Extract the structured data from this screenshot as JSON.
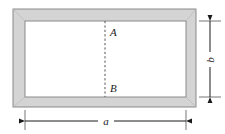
{
  "figure": {
    "type": "engineering-diagram",
    "background_color": "#ffffff",
    "frame": {
      "band_fill": "#d4d4d4",
      "outline_color": "#8a8a8a",
      "inner_fill": "#ffffff",
      "outer": {
        "x": 13,
        "y": 9,
        "width": 183,
        "height": 98
      },
      "inner": {
        "x": 25,
        "y": 21,
        "width": 161,
        "height": 76
      }
    },
    "cut_line": {
      "label_top": "A",
      "label_bottom": "B",
      "style": "dashed",
      "color": "#555555",
      "x": 105,
      "y_top": 21,
      "y_bottom": 97
    },
    "dimensions": [
      {
        "name": "height-dimension",
        "label": "b",
        "orientation": "vertical",
        "x": 210,
        "y_top": 21,
        "y_bottom": 97,
        "arrows": "both"
      },
      {
        "name": "width-dimension",
        "label": "a",
        "orientation": "horizontal",
        "y": 121,
        "x_left": 25,
        "x_right": 186,
        "arrows": "both"
      }
    ],
    "labels": {
      "point_a": "A",
      "point_b": "B",
      "width": "a",
      "height": "b"
    }
  }
}
